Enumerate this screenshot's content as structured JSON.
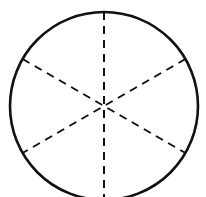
{
  "diagram": {
    "shape": "circle",
    "sectors": 6,
    "center": [
      104,
      106
    ],
    "radius": 94,
    "stroke_color": "#111111",
    "background_color": "#ffffff",
    "divider_style": "dashed",
    "divider_angles_deg": [
      90,
      30,
      150
    ]
  }
}
